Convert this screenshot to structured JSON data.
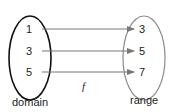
{
  "diagram": {
    "function_label": "f",
    "domain": {
      "label": "domain",
      "values": [
        "1",
        "3",
        "5"
      ],
      "stroke": "#111111"
    },
    "range": {
      "label": "range",
      "values": [
        "3",
        "5",
        "7"
      ],
      "stroke": "#8a8a8a"
    },
    "arrow_color": "#777777",
    "mappings": [
      {
        "from": "1",
        "to": "3"
      },
      {
        "from": "3",
        "to": "5"
      },
      {
        "from": "5",
        "to": "7"
      }
    ]
  }
}
